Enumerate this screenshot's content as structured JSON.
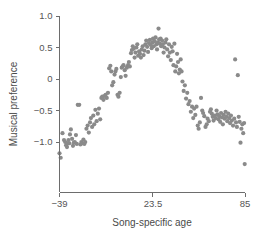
{
  "chart_data": {
    "type": "scatter",
    "title": "",
    "xlabel": "Song-specific age",
    "ylabel": "Musical preference",
    "xlim": [
      -39,
      85
    ],
    "ylim": [
      -1.45,
      1.05
    ],
    "grid": false,
    "legend": null,
    "x_ticks": [
      {
        "value": -39,
        "label": "−39"
      },
      {
        "value": 23.5,
        "label": "23.5"
      },
      {
        "value": 85,
        "label": "85"
      }
    ],
    "y_ticks": [
      {
        "value": 1.0,
        "label": "1.0"
      },
      {
        "value": 0.5,
        "label": "0.5"
      },
      {
        "value": 0.0,
        "label": "0"
      },
      {
        "value": -0.5,
        "label": "−0.5"
      },
      {
        "value": -1.0,
        "label": "−1.0"
      }
    ],
    "marker": {
      "shape": "circle",
      "color": "#8a8a8a",
      "size": 4.2
    },
    "point_count": 188,
    "points": [
      [
        -39.0,
        -1.18
      ],
      [
        -38.2,
        -1.25
      ],
      [
        -37.0,
        -0.86
      ],
      [
        -36.0,
        -0.97
      ],
      [
        -35.2,
        -1.0
      ],
      [
        -34.6,
        -1.05
      ],
      [
        -34.0,
        -1.08
      ],
      [
        -33.4,
        -1.02
      ],
      [
        -33.0,
        -0.97
      ],
      [
        -32.4,
        -1.02
      ],
      [
        -32.0,
        -0.88
      ],
      [
        -31.4,
        -0.8
      ],
      [
        -30.6,
        -0.95
      ],
      [
        -30.0,
        -1.06
      ],
      [
        -29.4,
        -1.01
      ],
      [
        -28.8,
        -1.0
      ],
      [
        -28.0,
        -0.89
      ],
      [
        -27.4,
        -1.03
      ],
      [
        -26.8,
        -0.41
      ],
      [
        -25.8,
        -0.41
      ],
      [
        -25.0,
        -1.04
      ],
      [
        -24.4,
        -1.0
      ],
      [
        -23.8,
        -1.02
      ],
      [
        -23.0,
        -0.96
      ],
      [
        -22.4,
        -1.03
      ],
      [
        -21.8,
        -1.0
      ],
      [
        -21.0,
        -0.79
      ],
      [
        -20.2,
        -0.74
      ],
      [
        -19.4,
        -0.85
      ],
      [
        -18.6,
        -0.69
      ],
      [
        -18.0,
        -0.62
      ],
      [
        -17.2,
        -0.76
      ],
      [
        -16.4,
        -0.58
      ],
      [
        -15.8,
        -0.72
      ],
      [
        -15.0,
        -0.49
      ],
      [
        -14.2,
        -0.67
      ],
      [
        -13.4,
        -0.55
      ],
      [
        -12.6,
        -0.47
      ],
      [
        -11.8,
        -0.64
      ],
      [
        -11.0,
        -0.3
      ],
      [
        -10.4,
        -0.28
      ],
      [
        -9.6,
        -0.33
      ],
      [
        -9.0,
        -0.27
      ],
      [
        -8.2,
        -0.25
      ],
      [
        -7.4,
        -0.3
      ],
      [
        -6.6,
        -0.22
      ],
      [
        -5.8,
        0.17
      ],
      [
        -5.0,
        0.21
      ],
      [
        -4.4,
        0.12
      ],
      [
        -3.8,
        -0.1
      ],
      [
        -3.0,
        -0.05
      ],
      [
        -2.2,
        0.07
      ],
      [
        -1.6,
        0.12
      ],
      [
        -1.0,
        0.16
      ],
      [
        -0.2,
        -0.25
      ],
      [
        0.4,
        -0.28
      ],
      [
        1.2,
        -0.22
      ],
      [
        2.0,
        0.03
      ],
      [
        2.6,
        0.18
      ],
      [
        3.2,
        0.2
      ],
      [
        3.8,
        0.22
      ],
      [
        4.6,
        0.14
      ],
      [
        5.2,
        0.05
      ],
      [
        6.0,
        0.18
      ],
      [
        6.8,
        0.22
      ],
      [
        7.4,
        0.27
      ],
      [
        8.0,
        0.2
      ],
      [
        8.8,
        0.41
      ],
      [
        9.4,
        0.46
      ],
      [
        10.0,
        0.52
      ],
      [
        10.6,
        0.48
      ],
      [
        11.2,
        0.34
      ],
      [
        11.8,
        0.42
      ],
      [
        12.4,
        0.5
      ],
      [
        13.0,
        0.55
      ],
      [
        13.6,
        0.37
      ],
      [
        14.2,
        0.44
      ],
      [
        14.8,
        0.4
      ],
      [
        15.4,
        0.34
      ],
      [
        16.0,
        0.47
      ],
      [
        16.6,
        0.52
      ],
      [
        17.2,
        0.38
      ],
      [
        17.8,
        0.45
      ],
      [
        18.4,
        0.55
      ],
      [
        19.0,
        0.61
      ],
      [
        19.6,
        0.51
      ],
      [
        20.2,
        0.43
      ],
      [
        20.8,
        0.57
      ],
      [
        21.4,
        0.62
      ],
      [
        22.0,
        0.54
      ],
      [
        22.6,
        0.49
      ],
      [
        23.2,
        0.58
      ],
      [
        23.5,
        0.64
      ],
      [
        24.0,
        0.52
      ],
      [
        24.6,
        0.6
      ],
      [
        25.2,
        0.66
      ],
      [
        25.8,
        0.55
      ],
      [
        26.2,
        0.47
      ],
      [
        26.8,
        0.58
      ],
      [
        27.2,
        0.8
      ],
      [
        27.6,
        0.63
      ],
      [
        28.0,
        0.56
      ],
      [
        28.6,
        0.64
      ],
      [
        29.0,
        0.52
      ],
      [
        29.6,
        0.61
      ],
      [
        30.0,
        0.55
      ],
      [
        30.6,
        0.42
      ],
      [
        31.2,
        0.5
      ],
      [
        31.8,
        0.58
      ],
      [
        32.4,
        0.63
      ],
      [
        33.0,
        0.47
      ],
      [
        33.6,
        0.36
      ],
      [
        34.2,
        0.55
      ],
      [
        34.8,
        0.42
      ],
      [
        35.4,
        0.3
      ],
      [
        36.0,
        0.51
      ],
      [
        36.6,
        0.44
      ],
      [
        37.2,
        0.22
      ],
      [
        37.8,
        0.56
      ],
      [
        38.4,
        0.12
      ],
      [
        39.0,
        0.2
      ],
      [
        39.6,
        0.4
      ],
      [
        40.2,
        0.27
      ],
      [
        40.8,
        0.09
      ],
      [
        41.4,
        0.15
      ],
      [
        42.0,
        0.31
      ],
      [
        42.6,
        0.12
      ],
      [
        43.2,
        -0.04
      ],
      [
        44.0,
        -0.19
      ],
      [
        44.8,
        -0.1
      ],
      [
        45.6,
        -0.31
      ],
      [
        46.4,
        -0.22
      ],
      [
        47.2,
        -0.4
      ],
      [
        48.0,
        -0.35
      ],
      [
        48.8,
        -0.52
      ],
      [
        49.6,
        -0.44
      ],
      [
        50.4,
        -0.62
      ],
      [
        51.0,
        -0.47
      ],
      [
        51.8,
        -0.57
      ],
      [
        52.6,
        -0.44
      ],
      [
        53.4,
        -0.74
      ],
      [
        54.0,
        -0.79
      ],
      [
        54.8,
        -0.69
      ],
      [
        55.6,
        -0.3
      ],
      [
        56.4,
        -0.5
      ],
      [
        57.0,
        -0.54
      ],
      [
        57.8,
        -0.59
      ],
      [
        58.6,
        -0.76
      ],
      [
        59.4,
        -0.72
      ],
      [
        60.0,
        -0.63
      ],
      [
        60.8,
        -0.67
      ],
      [
        61.6,
        -0.52
      ],
      [
        62.2,
        -0.48
      ],
      [
        62.8,
        -0.55
      ],
      [
        63.4,
        -0.6
      ],
      [
        64.0,
        -0.66
      ],
      [
        64.8,
        -0.58
      ],
      [
        65.4,
        -0.62
      ],
      [
        66.0,
        -0.5
      ],
      [
        66.6,
        -0.56
      ],
      [
        67.2,
        -0.64
      ],
      [
        67.8,
        -0.59
      ],
      [
        68.4,
        -0.68
      ],
      [
        69.0,
        -0.54
      ],
      [
        69.6,
        -0.61
      ],
      [
        70.2,
        -0.72
      ],
      [
        70.8,
        -0.57
      ],
      [
        71.4,
        -0.63
      ],
      [
        72.0,
        -0.52
      ],
      [
        72.6,
        -0.6
      ],
      [
        73.2,
        -0.67
      ],
      [
        73.8,
        -0.55
      ],
      [
        74.4,
        -0.62
      ],
      [
        75.0,
        -0.7
      ],
      [
        75.6,
        -0.58
      ],
      [
        76.2,
        -0.66
      ],
      [
        77.0,
        -0.74
      ],
      [
        77.8,
        -0.63
      ],
      [
        78.4,
        0.31
      ],
      [
        79.0,
        -0.69
      ],
      [
        79.6,
        -0.76
      ],
      [
        80.2,
        0.06
      ],
      [
        80.8,
        -0.6
      ],
      [
        81.4,
        -0.68
      ],
      [
        82.0,
        -1.01
      ],
      [
        82.6,
        -0.79
      ],
      [
        83.2,
        -0.72
      ],
      [
        83.8,
        -0.86
      ],
      [
        84.4,
        -0.7
      ],
      [
        84.8,
        -1.35
      ]
    ]
  }
}
